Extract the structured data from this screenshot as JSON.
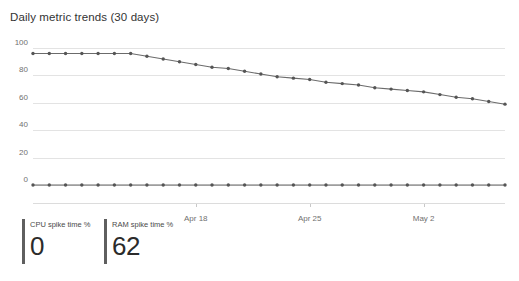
{
  "chart": {
    "title": "Daily metric trends (30 days)",
    "axis_line_color": "#dcdcdc",
    "grid_color": "#e3e3e3"
  },
  "kpis": [
    {
      "label": "CPU spike time %",
      "value": "0",
      "accent": "#5f5f5f"
    },
    {
      "label": "RAM spike time %",
      "value": "62",
      "accent": "#5f5f5f"
    }
  ],
  "chart_data": {
    "type": "line",
    "title": "Daily metric trends (30 days)",
    "xlabel": "",
    "ylabel": "",
    "ylim": [
      0,
      100
    ],
    "yticks": [
      0,
      20,
      40,
      60,
      80,
      100
    ],
    "grid": true,
    "legend": "none",
    "line_color": "#6b6b6b",
    "marker": "circle",
    "x": [
      "Apr 8",
      "Apr 9",
      "Apr 10",
      "Apr 11",
      "Apr 12",
      "Apr 13",
      "Apr 14",
      "Apr 15",
      "Apr 16",
      "Apr 17",
      "Apr 18",
      "Apr 19",
      "Apr 20",
      "Apr 21",
      "Apr 22",
      "Apr 23",
      "Apr 24",
      "Apr 25",
      "Apr 26",
      "Apr 27",
      "Apr 28",
      "Apr 29",
      "Apr 30",
      "May 1",
      "May 2",
      "May 3",
      "May 4",
      "May 5",
      "May 6",
      "May 7"
    ],
    "xtick_labels": [
      "Apr 18",
      "Apr 25",
      "May 2"
    ],
    "xtick_indices": [
      10,
      17,
      24
    ],
    "series": [
      {
        "name": "RAM spike time %",
        "values": [
          96,
          96,
          96,
          96,
          96,
          96,
          96,
          94,
          92,
          90,
          88,
          86,
          85,
          83,
          81,
          79,
          78,
          77,
          75,
          74,
          73,
          71,
          70,
          69,
          68,
          66,
          64,
          63,
          61,
          59
        ]
      },
      {
        "name": "CPU spike time %",
        "values": [
          0,
          0,
          0,
          0,
          0,
          0,
          0,
          0,
          0,
          0,
          0,
          0,
          0,
          0,
          0,
          0,
          0,
          0,
          0,
          0,
          0,
          0,
          0,
          0,
          0,
          0,
          0,
          0,
          0,
          0
        ]
      }
    ]
  }
}
